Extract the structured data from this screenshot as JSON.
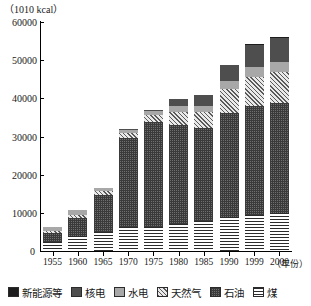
{
  "chart_data": {
    "type": "bar",
    "stacked": true,
    "title": "",
    "unit_label": "（1010 kcal）",
    "xlabel": "（年份）",
    "ylabel": "",
    "ylim": [
      0,
      60000
    ],
    "ytick_values": [
      0,
      10000,
      20000,
      30000,
      40000,
      50000,
      60000
    ],
    "ytick_labels": [
      "0",
      "10000",
      "20000",
      "30000",
      "40000",
      "50000",
      "60000"
    ],
    "grid": false,
    "legend_position": "bottom",
    "categories": [
      "1955",
      "1960",
      "1965",
      "1970",
      "1975",
      "1980",
      "1985",
      "1990",
      "1999",
      "2000"
    ],
    "series": [
      {
        "name": "煤",
        "name_en": "coal",
        "pattern": "horizontal-lines",
        "values": [
          2400,
          4000,
          5100,
          6200,
          6300,
          7000,
          7800,
          8900,
          9400,
          10000
        ]
      },
      {
        "name": "石油",
        "name_en": "oil",
        "pattern": "checker",
        "values": [
          2200,
          4700,
          9600,
          23500,
          27600,
          25900,
          24500,
          27200,
          28600,
          28800
        ]
      },
      {
        "name": "天然气",
        "name_en": "natural-gas",
        "pattern": "diagonal-hatch",
        "values": [
          700,
          800,
          900,
          1100,
          1700,
          3400,
          4000,
          6400,
          7700,
          8000
        ]
      },
      {
        "name": "水电",
        "name_en": "hydropower",
        "pattern": "solid-light-grey",
        "values": [
          1100,
          1200,
          900,
          1000,
          1100,
          1600,
          1800,
          2100,
          2500,
          2700
        ]
      },
      {
        "name": "核电",
        "name_en": "nuclear-power",
        "pattern": "solid-dark-grey",
        "values": [
          0,
          0,
          0,
          200,
          300,
          2000,
          2700,
          4100,
          5900,
          6300
        ]
      },
      {
        "name": "新能源等",
        "name_en": "new-energy-etc",
        "pattern": "solid-black",
        "values": [
          0,
          0,
          0,
          0,
          0,
          0,
          0,
          0,
          200,
          300
        ]
      }
    ],
    "totals": [
      6400,
      10700,
      16500,
      32000,
      37000,
      39900,
      40800,
      48700,
      54300,
      56100
    ]
  },
  "legend": {
    "items": [
      {
        "label": "新能源等",
        "key": "newenergy"
      },
      {
        "label": "核电",
        "key": "nuclear"
      },
      {
        "label": "水电",
        "key": "hydro"
      },
      {
        "label": "天然气",
        "key": "gas"
      },
      {
        "label": "石油",
        "key": "oil"
      },
      {
        "label": "煤",
        "key": "coal"
      }
    ]
  },
  "colors": {
    "axis": "#000000",
    "coal": "#2b2b2b",
    "oil": "#3a3a3a",
    "gas": "#5a5a5a",
    "hydro": "#a8a8a8",
    "nuclear": "#4e4e4e",
    "newenergy": "#1d1d1d",
    "background": "#ffffff"
  }
}
